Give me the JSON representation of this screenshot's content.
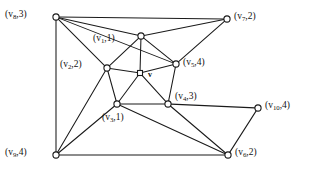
{
  "figure": {
    "type": "labeled-undirected-graph",
    "width": 323,
    "height": 178,
    "background_color": "#ffffff",
    "line_color": "#1a1a1a",
    "node_fill_color": "#ffffff",
    "center_vertex_label": "v"
  },
  "vertices": [
    {
      "id": "v8",
      "label": "(v",
      "sub": "8",
      "sep": ",",
      "value": "3)",
      "x": 56,
      "y": 17,
      "label_x": 5,
      "label_y": 10,
      "anchor": "right"
    },
    {
      "id": "v7",
      "label": "(v",
      "sub": "7",
      "sep": ",",
      "value": "2)",
      "x": 227,
      "y": 19,
      "label_x": 234,
      "label_y": 12,
      "anchor": "left"
    },
    {
      "id": "v1",
      "label": "(v",
      "sub": "1",
      "sep": ",",
      "value": "1)",
      "x": 141,
      "y": 36,
      "label_x": 93,
      "label_y": 34,
      "anchor": "left"
    },
    {
      "id": "v5",
      "label": "(v",
      "sub": "5",
      "sep": ",",
      "value": "4)",
      "x": 176,
      "y": 64,
      "label_x": 183,
      "label_y": 58,
      "anchor": "left"
    },
    {
      "id": "v2",
      "label": "(v",
      "sub": "2",
      "sep": ",",
      "value": "2)",
      "x": 107,
      "y": 68,
      "label_x": 60,
      "label_y": 60,
      "anchor": "left"
    },
    {
      "id": "v3",
      "label": "(v",
      "sub": "3",
      "sep": ",",
      "value": "1)",
      "x": 117,
      "y": 104,
      "label_x": 102,
      "label_y": 113,
      "anchor": "left"
    },
    {
      "id": "v4",
      "label": "(v",
      "sub": "4",
      "sep": ",",
      "value": "3)",
      "x": 168,
      "y": 104,
      "label_x": 175,
      "label_y": 92,
      "anchor": "left"
    },
    {
      "id": "v10",
      "label": "(v",
      "sub": "10",
      "sep": ",",
      "value": "4)",
      "x": 258,
      "y": 108,
      "label_x": 265,
      "label_y": 101,
      "anchor": "left"
    },
    {
      "id": "v9",
      "label": "(v",
      "sub": "9",
      "sep": ",",
      "value": "4)",
      "x": 56,
      "y": 155,
      "label_x": 5,
      "label_y": 148,
      "anchor": "right"
    },
    {
      "id": "v6",
      "label": "(v",
      "sub": "6",
      "sep": ",",
      "value": "2)",
      "x": 228,
      "y": 155,
      "label_x": 235,
      "label_y": 148,
      "anchor": "left"
    },
    {
      "id": "v",
      "label": "v",
      "sub": "",
      "sep": "",
      "value": "",
      "x": 140,
      "y": 73,
      "label_x": 148,
      "label_y": 71,
      "anchor": "left"
    }
  ],
  "edges": [
    {
      "from": "v8",
      "to": "v7"
    },
    {
      "from": "v8",
      "to": "v5"
    },
    {
      "from": "v8",
      "to": "v2"
    },
    {
      "from": "v8",
      "to": "v9"
    },
    {
      "from": "v8",
      "to": "v1"
    },
    {
      "from": "v1",
      "to": "v7"
    },
    {
      "from": "v1",
      "to": "v5"
    },
    {
      "from": "v1",
      "to": "v2"
    },
    {
      "from": "v1",
      "to": "v"
    },
    {
      "from": "v7",
      "to": "v5"
    },
    {
      "from": "v2",
      "to": "v"
    },
    {
      "from": "v2",
      "to": "v3"
    },
    {
      "from": "v2",
      "to": "v9"
    },
    {
      "from": "v5",
      "to": "v"
    },
    {
      "from": "v5",
      "to": "v4"
    },
    {
      "from": "v",
      "to": "v3"
    },
    {
      "from": "v",
      "to": "v4"
    },
    {
      "from": "v3",
      "to": "v4"
    },
    {
      "from": "v3",
      "to": "v9"
    },
    {
      "from": "v3",
      "to": "v6"
    },
    {
      "from": "v4",
      "to": "v10"
    },
    {
      "from": "v4",
      "to": "v6"
    },
    {
      "from": "v9",
      "to": "v6"
    },
    {
      "from": "v10",
      "to": "v6"
    }
  ]
}
